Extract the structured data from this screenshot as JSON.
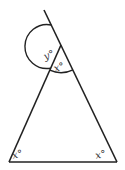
{
  "diagram": {
    "type": "triangle-exterior-angle",
    "stroke_color": "#222222",
    "label_color": "#333333",
    "labels": {
      "exterior_angle": "y°",
      "apex_interior_angle": "x°",
      "bottom_left_angle": "x°",
      "bottom_right_angle": "x°"
    },
    "points": {
      "apex": [
        61,
        45
      ],
      "bottom_left": [
        9,
        162
      ],
      "bottom_right": [
        117,
        162
      ],
      "extension_end": [
        44,
        10
      ]
    }
  }
}
